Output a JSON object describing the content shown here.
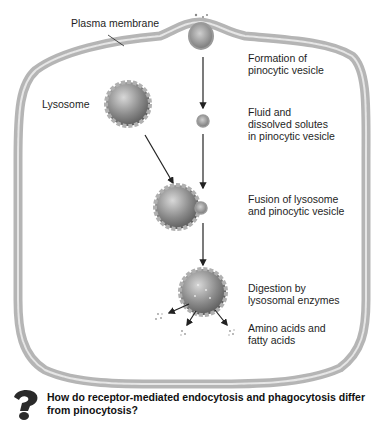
{
  "figure": {
    "title": "Pinocytosis",
    "labels": {
      "plasma_membrane": "Plasma membrane",
      "lysosome": "Lysosome",
      "formation": "Formation of\npinocytic vesicle",
      "fluid": "Fluid and\ndissolved solutes\nin pinocytic vesicle",
      "fusion": "Fusion of lysosome\nand pinocytic vesicle",
      "digestion": "Digestion by\nlysosomal enzymes",
      "products": "Amino acids and\nfatty acids"
    },
    "steps": [
      "Formation of pinocytic vesicle",
      "Fluid and dissolved solutes in pinocytic vesicle",
      "Fusion of lysosome and pinocytic vesicle",
      "Digestion by lysosomal enzymes",
      "Amino acids and fatty acids"
    ],
    "colors": {
      "membrane": "#9a9a9a",
      "membrane_light": "#d6d6d6",
      "vesicle_dark": "#6e6e6e",
      "vesicle_light": "#cfcfcf",
      "arrow": "#222222"
    }
  },
  "question": {
    "icon": "question-mark-icon",
    "text": "How do receptor-mediated endocytosis and phagocytosis differ from pinocytosis?"
  }
}
